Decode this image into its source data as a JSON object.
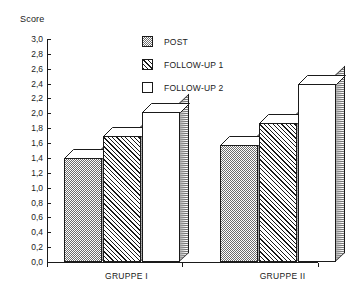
{
  "chart_data": {
    "type": "bar",
    "title": "",
    "subtitle": "",
    "xlabel": "",
    "ylabel": "Score",
    "ylim": [
      0.0,
      3.0
    ],
    "ytick_step": 0.2,
    "grid": false,
    "legend_position": "top-center",
    "decimal_separator": ",",
    "categories": [
      "GRUPPE I",
      "GRUPPE II"
    ],
    "ytick_labels": [
      "3,0",
      "2,8",
      "2,6",
      "2,4",
      "2,2",
      "2,0",
      "1,8",
      "1,6",
      "1,4",
      "1,2",
      "1,0",
      "0,8",
      "0,6",
      "0,4",
      "0,2",
      "0,0"
    ],
    "ytick_values": [
      3.0,
      2.8,
      2.6,
      2.4,
      2.2,
      2.0,
      1.8,
      1.6,
      1.4,
      1.2,
      1.0,
      0.8,
      0.6,
      0.4,
      0.2,
      0.0
    ],
    "series": [
      {
        "name": "POST",
        "fill": "dotted-gray",
        "values": [
          1.4,
          1.57
        ]
      },
      {
        "name": "FOLLOW-UP 1",
        "fill": "diagonal-hatch",
        "values": [
          1.7,
          1.87
        ]
      },
      {
        "name": "FOLLOW-UP 2",
        "fill": "white",
        "values": [
          2.02,
          2.4
        ]
      }
    ]
  },
  "axis": {
    "y_title": "Score"
  },
  "legend": {
    "items": [
      {
        "label": "POST"
      },
      {
        "label": "FOLLOW-UP 1"
      },
      {
        "label": "FOLLOW-UP 2"
      }
    ]
  },
  "colors": {
    "ink": "#1a1a1a",
    "background": "#ffffff",
    "pattern_gray": "#6e6e6e"
  }
}
